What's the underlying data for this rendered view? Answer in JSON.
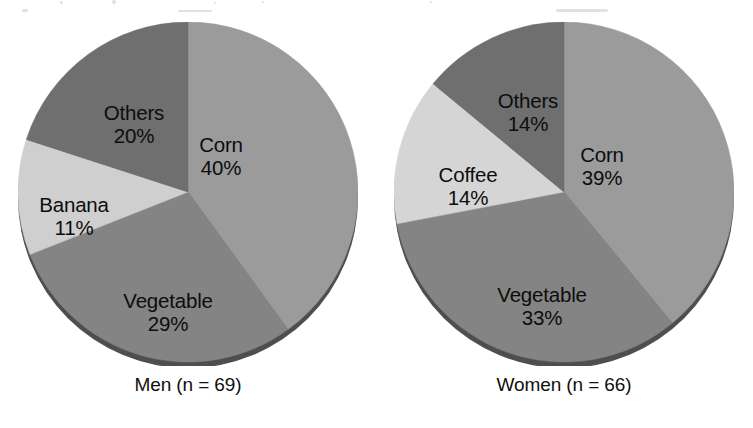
{
  "figure": {
    "background_color": "#ffffff",
    "text_color": "#0d0d0d"
  },
  "palette": {
    "corn": "#9b9b9b",
    "vegetable": "#848484",
    "others": "#6f6f6f",
    "banana": "#cfcfcf",
    "coffee": "#d5d5d5",
    "rim_shadow": "#4a4a4a",
    "edge": "#8c8c8c"
  },
  "charts": [
    {
      "id": "men",
      "caption": "Men (n = 69)",
      "group": "Men",
      "n": 69,
      "slices": [
        {
          "label": "Corn",
          "pct": "40%",
          "value": 40,
          "color": "#9b9b9b"
        },
        {
          "label": "Vegetable",
          "pct": "29%",
          "value": 29,
          "color": "#848484"
        },
        {
          "label": "Banana",
          "pct": "11%",
          "value": 11,
          "color": "#cfcfcf"
        },
        {
          "label": "Others",
          "pct": "20%",
          "value": 20,
          "color": "#6f6f6f"
        }
      ]
    },
    {
      "id": "women",
      "caption": "Women (n = 66)",
      "group": "Women",
      "n": 66,
      "slices": [
        {
          "label": "Corn",
          "pct": "39%",
          "value": 39,
          "color": "#9b9b9b"
        },
        {
          "label": "Vegetable",
          "pct": "33%",
          "value": 33,
          "color": "#848484"
        },
        {
          "label": "Coffee",
          "pct": "14%",
          "value": 14,
          "color": "#d5d5d5"
        },
        {
          "label": "Others",
          "pct": "14%",
          "value": 14,
          "color": "#6f6f6f"
        }
      ]
    }
  ],
  "chart_data": [
    {
      "type": "pie",
      "title": "Men (n = 69)",
      "categories": [
        "Corn",
        "Vegetable",
        "Banana",
        "Others"
      ],
      "values": [
        40,
        29,
        11,
        20
      ],
      "value_labels": [
        "40%",
        "29%",
        "11%",
        "20%"
      ],
      "unit": "percent",
      "sample_size": 69,
      "colors": [
        "#9b9b9b",
        "#848484",
        "#cfcfcf",
        "#6f6f6f"
      ],
      "start_angle_deg": 0,
      "direction": "clockwise",
      "labels_position": "inside-slice",
      "legend": "none",
      "grid": false,
      "three_d": true
    },
    {
      "type": "pie",
      "title": "Women (n = 66)",
      "categories": [
        "Corn",
        "Vegetable",
        "Coffee",
        "Others"
      ],
      "values": [
        39,
        33,
        14,
        14
      ],
      "value_labels": [
        "39%",
        "33%",
        "14%",
        "14%"
      ],
      "unit": "percent",
      "sample_size": 66,
      "colors": [
        "#9b9b9b",
        "#848484",
        "#d5d5d5",
        "#6f6f6f"
      ],
      "start_angle_deg": 0,
      "direction": "clockwise",
      "labels_position": "inside-slice",
      "legend": "none",
      "grid": false,
      "three_d": true
    }
  ],
  "label_layout": {
    "men": [
      {
        "left": 203,
        "top": 112
      },
      {
        "left": 150,
        "top": 268
      },
      {
        "left": 56,
        "top": 172
      },
      {
        "left": 116,
        "top": 80
      }
    ],
    "women": [
      {
        "left": 208,
        "top": 122
      },
      {
        "left": 148,
        "top": 262
      },
      {
        "left": 74,
        "top": 142
      },
      {
        "left": 134,
        "top": 68
      }
    ]
  }
}
